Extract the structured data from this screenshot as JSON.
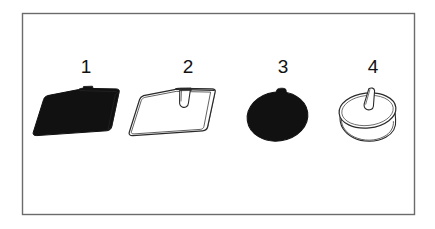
{
  "plate": {
    "background_color": "#ffffff",
    "frame": {
      "stroke_color": "#6b6b6b",
      "stroke_width": 1.4,
      "x": 22,
      "y": 13,
      "width": 393,
      "height": 202
    },
    "ink_color": "#111111",
    "outline_color": "#3a3a3a"
  },
  "figures": [
    {
      "number": "1",
      "name": "solid-black-pad",
      "style": "filled",
      "fill_color": "#111111",
      "description": "Solid black rounded square pad shown in perspective with a small tab at the top edge",
      "label_x": 86,
      "label_y": 57
    },
    {
      "number": "2",
      "name": "outlined-pad",
      "style": "outline",
      "fill_color": "#ffffff",
      "description": "Line-art rounded square pad in perspective with a raised tab at the top center and a layered shaded right edge",
      "label_x": 188,
      "label_y": 57
    },
    {
      "number": "3",
      "name": "solid-black-oval",
      "style": "filled",
      "fill_color": "#111111",
      "description": "Solid black oval blob with a small bump on the upper edge",
      "label_x": 283,
      "label_y": 57
    },
    {
      "number": "4",
      "name": "outlined-dome",
      "style": "outline",
      "fill_color": "#ffffff",
      "description": "Line-art oval dome with visible side thickness and a slanted tab on the top face",
      "label_x": 373,
      "label_y": 57
    }
  ],
  "labels": {
    "fig1": "1",
    "fig2": "2",
    "fig3": "3",
    "fig4": "4"
  }
}
